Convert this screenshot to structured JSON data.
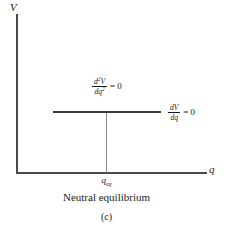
{
  "figure": {
    "axes": {
      "y_label": "V",
      "x_label": "q"
    },
    "annotations": {
      "second_derivative": {
        "numerator": "d",
        "numerator_sup": "2",
        "numerator_var": "V",
        "denominator": "dq",
        "denominator_sup": "2",
        "relation": "=",
        "value": "0"
      },
      "first_derivative": {
        "numerator": "dV",
        "denominator": "dq",
        "relation": "=",
        "value": "0"
      }
    },
    "tick_label": {
      "base": "q",
      "subscript": "eq"
    },
    "caption": "Neutral equilibrium",
    "panel_label": "(c)"
  },
  "chart_data": {
    "type": "line",
    "title": "Neutral equilibrium",
    "xlabel": "q",
    "ylabel": "V",
    "grid": false,
    "legend": null,
    "series": [
      {
        "name": "V(q)",
        "comment": "flat plateau: potential energy constant over the plotted range",
        "x": [
          0.2,
          0.35,
          0.5,
          0.65,
          0.78
        ],
        "y": [
          0.38,
          0.38,
          0.38,
          0.38,
          0.38
        ]
      }
    ],
    "reference_lines": [
      {
        "name": "q_eq dropline",
        "orientation": "vertical",
        "x": 0.47,
        "from_y": 0.0,
        "to_y": 0.38
      }
    ],
    "annotations": [
      {
        "text": "d2V/dq2 = 0",
        "x": 0.4,
        "y": 0.52
      },
      {
        "text": "dV/dq = 0",
        "x": 0.8,
        "y": 0.38
      },
      {
        "text": "q_eq",
        "x": 0.47,
        "y": -0.04
      }
    ],
    "xlim": [
      0,
      1
    ],
    "ylim": [
      0,
      1
    ],
    "xticks": [
      "q_eq"
    ],
    "yticks": []
  }
}
